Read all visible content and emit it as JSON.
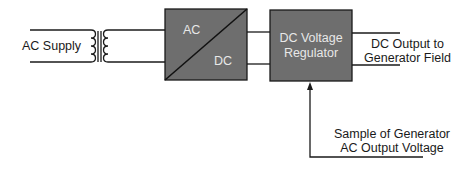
{
  "diagram": {
    "type": "block-diagram",
    "colors": {
      "block_fill": "#6e6e6e",
      "block_stroke": "#1a1a1a",
      "line": "#1a1a1a",
      "block_text": "#e8e8e8"
    },
    "labels": {
      "ac_supply": "AC Supply",
      "rectifier_ac": "AC",
      "rectifier_dc": "DC",
      "regulator_line1": "DC Voltage",
      "regulator_line2": "Regulator",
      "output_line1": "DC Output to",
      "output_line2": "Generator Field",
      "sample_line1": "Sample of Generator",
      "sample_line2": "AC Output Voltage"
    },
    "nodes": [
      {
        "id": "ac-supply",
        "label": "AC Supply"
      },
      {
        "id": "transformer",
        "label": ""
      },
      {
        "id": "rectifier",
        "label": "AC / DC"
      },
      {
        "id": "regulator",
        "label": "DC Voltage Regulator"
      },
      {
        "id": "output",
        "label": "DC Output to Generator Field"
      },
      {
        "id": "sample",
        "label": "Sample of Generator AC Output Voltage"
      }
    ],
    "edges": [
      {
        "from": "ac-supply",
        "to": "transformer"
      },
      {
        "from": "transformer",
        "to": "rectifier"
      },
      {
        "from": "rectifier",
        "to": "regulator"
      },
      {
        "from": "regulator",
        "to": "output"
      },
      {
        "from": "sample",
        "to": "regulator",
        "arrow": true
      }
    ]
  }
}
